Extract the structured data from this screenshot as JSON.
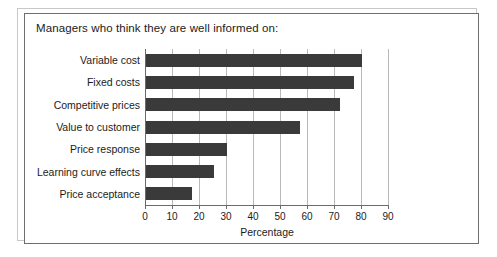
{
  "chart_data": {
    "type": "bar",
    "orientation": "horizontal",
    "title": "Managers who think they are well informed on:",
    "xlabel": "Percentage",
    "ylabel": "",
    "xlim": [
      0,
      90
    ],
    "xticks": [
      0,
      10,
      20,
      30,
      40,
      50,
      60,
      70,
      80,
      90
    ],
    "grid": true,
    "legend": false,
    "bar_color": "#3a3a3a",
    "categories": [
      "Variable cost",
      "Fixed costs",
      "Competitive prices",
      "Value to customer",
      "Price response",
      "Learning curve effects",
      "Price acceptance"
    ],
    "values": [
      80,
      77,
      72,
      57,
      30,
      25,
      17
    ]
  },
  "figure": {
    "background": "#ffffff",
    "frame_color": "#6e6e72",
    "gridline_color": "#b9b9b9"
  }
}
